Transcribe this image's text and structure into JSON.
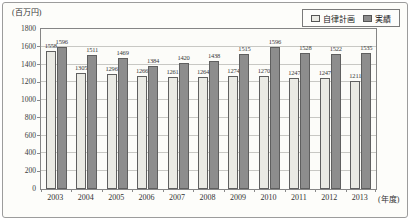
{
  "chart_data": {
    "type": "bar",
    "unit_label": "(百万円)",
    "xlabel": "(年度)",
    "ylim": [
      0,
      1800
    ],
    "ytick_step": 200,
    "grid": true,
    "legend_position": "top-right",
    "categories": [
      "2003",
      "2004",
      "2005",
      "2006",
      "2007",
      "2008",
      "2009",
      "2010",
      "2011",
      "2012",
      "2013"
    ],
    "series": [
      {
        "name": "自律計画",
        "color": "#eaeae4",
        "values": [
          1558,
          1305,
          1296,
          1266,
          1261,
          1264,
          1274,
          1270,
          1247,
          1247,
          1211
        ]
      },
      {
        "name": "実績",
        "color": "#8d8d8d",
        "values": [
          1596,
          1511,
          1469,
          1384,
          1420,
          1438,
          1515,
          1596,
          1528,
          1522,
          1535
        ]
      }
    ]
  }
}
